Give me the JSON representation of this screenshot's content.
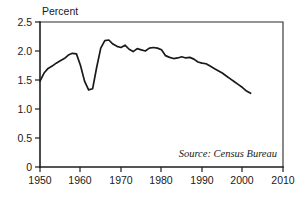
{
  "chart_data": {
    "type": "line",
    "title": "",
    "subtitle": "",
    "xlabel": "",
    "ylabel": "Percent",
    "ylabel_position": "top-left",
    "xlim": [
      1950,
      2010
    ],
    "ylim": [
      0,
      2.5
    ],
    "grid": false,
    "legend": null,
    "annotations": [
      {
        "name": "source-note",
        "text": "Source: Census Bureau",
        "x": 2000,
        "y": 0.32,
        "align": "right",
        "style": "italic"
      }
    ],
    "x_ticks": [
      1950,
      1960,
      1970,
      1980,
      1990,
      2000,
      2010
    ],
    "x_tick_labels": [
      "1950",
      "1960",
      "1970",
      "1980",
      "1990",
      "2000",
      "2010"
    ],
    "y_ticks": [
      0,
      0.5,
      1.0,
      1.5,
      2.0,
      2.5
    ],
    "y_tick_labels": [
      "0",
      "0.5",
      "1.0",
      "1.5",
      "2.0",
      "2.5"
    ],
    "series": [
      {
        "name": "percent",
        "color": "#1a1a1a",
        "x": [
          1950,
          1951,
          1952,
          1953,
          1954,
          1955,
          1956,
          1957,
          1958,
          1959,
          1960,
          1961,
          1962,
          1963,
          1964,
          1965,
          1966,
          1967,
          1968,
          1969,
          1970,
          1971,
          1972,
          1973,
          1974,
          1975,
          1976,
          1977,
          1978,
          1979,
          1980,
          1981,
          1982,
          1983,
          1984,
          1985,
          1986,
          1987,
          1988,
          1989,
          1990,
          1991,
          1992,
          1993,
          1994,
          1995,
          1996,
          1997,
          1998,
          1999,
          2000,
          2001,
          2002
        ],
        "values": [
          1.48,
          1.62,
          1.7,
          1.74,
          1.79,
          1.83,
          1.87,
          1.93,
          1.96,
          1.95,
          1.75,
          1.48,
          1.33,
          1.35,
          1.72,
          2.05,
          2.18,
          2.19,
          2.12,
          2.08,
          2.06,
          2.1,
          2.03,
          1.99,
          2.04,
          2.02,
          2.0,
          2.05,
          2.06,
          2.05,
          2.02,
          1.92,
          1.89,
          1.87,
          1.88,
          1.9,
          1.88,
          1.89,
          1.86,
          1.81,
          1.79,
          1.78,
          1.74,
          1.7,
          1.66,
          1.62,
          1.57,
          1.52,
          1.47,
          1.42,
          1.37,
          1.31,
          1.27
        ]
      }
    ]
  },
  "figure": {
    "percent_label": "Percent",
    "source_label": "Source: Census Bureau"
  }
}
